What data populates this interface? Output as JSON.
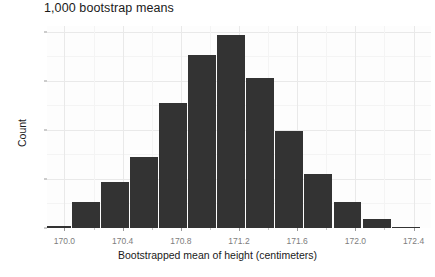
{
  "chart_data": {
    "type": "bar",
    "title": "1,000 bootstrap means",
    "xlabel": "Bootstrapped mean of height (centimeters)",
    "ylabel": "Count",
    "grid": true,
    "legend": "none",
    "xlim": [
      169.88,
      172.52
    ],
    "ylim": [
      0,
      206
    ],
    "bin_width": 0.2,
    "xticks": [
      170.0,
      170.4,
      170.8,
      171.2,
      171.6,
      172.0,
      172.4
    ],
    "xtick_labels": [
      "170.0",
      "170.4",
      "170.8",
      "171.2",
      "171.6",
      "172.0",
      "172.4"
    ],
    "yticks": [
      0,
      50,
      100,
      150,
      200
    ],
    "ytick_labels": [
      "0",
      "50",
      "100",
      "150",
      "200"
    ],
    "yticks_minor": [
      25,
      75,
      125,
      175
    ],
    "xticks_minor": [
      170.2,
      170.6,
      171.0,
      171.4,
      171.8,
      172.2
    ],
    "bar_color": "#333333",
    "panel_color": "#fdfdfd",
    "grid_color": "#e9e9e9",
    "categories": [
      "169.9",
      "170.1",
      "170.3",
      "170.5",
      "170.7",
      "170.9",
      "171.1",
      "171.3",
      "171.5",
      "171.7",
      "171.9",
      "172.1",
      "172.3"
    ],
    "bin_centers": [
      169.95,
      170.15,
      170.35,
      170.55,
      170.75,
      170.95,
      171.15,
      171.35,
      171.55,
      171.75,
      171.95,
      172.15,
      172.35
    ],
    "bin_edges": [
      169.85,
      170.05,
      170.25,
      170.45,
      170.65,
      170.85,
      171.05,
      171.25,
      171.45,
      171.65,
      171.85,
      172.05,
      172.25,
      172.45
    ],
    "values": [
      2,
      27,
      47,
      72,
      128,
      176,
      197,
      153,
      99,
      55,
      27,
      9,
      1
    ]
  }
}
